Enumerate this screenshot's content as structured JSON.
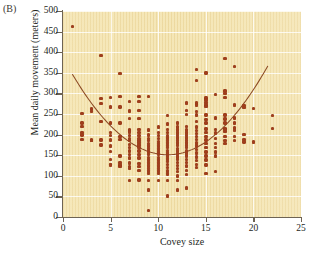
{
  "panel": {
    "label": "(B)"
  },
  "chart_data": {
    "type": "scatter",
    "title": "",
    "subtitle": "",
    "xlabel": "Covey size",
    "ylabel": "Mean daily movement (meters)",
    "xlim": [
      0,
      25
    ],
    "ylim": [
      0,
      500
    ],
    "xticks": [
      0,
      5,
      10,
      15,
      20,
      25
    ],
    "yticks": [
      0,
      50,
      100,
      150,
      200,
      250,
      300,
      350,
      400,
      450,
      500
    ],
    "grid": true,
    "legend": null,
    "legend_position": "none",
    "marker_color": "#a03e1c",
    "curve_color": "#8c4a24",
    "plot_background": "#f5e7b8",
    "points": [
      [
        1,
        462
      ],
      [
        2,
        251
      ],
      [
        2,
        228
      ],
      [
        2,
        219
      ],
      [
        2,
        205
      ],
      [
        2,
        199
      ],
      [
        2,
        188
      ],
      [
        3,
        262
      ],
      [
        3,
        256
      ],
      [
        3,
        187
      ],
      [
        3,
        186
      ],
      [
        4,
        392
      ],
      [
        4,
        288
      ],
      [
        4,
        275
      ],
      [
        4,
        232
      ],
      [
        4,
        187
      ],
      [
        4,
        175
      ],
      [
        5,
        290
      ],
      [
        5,
        267
      ],
      [
        5,
        228
      ],
      [
        5,
        205
      ],
      [
        5,
        198
      ],
      [
        5,
        187
      ],
      [
        5,
        172
      ],
      [
        5,
        159
      ],
      [
        5,
        140
      ],
      [
        5,
        128
      ],
      [
        5,
        126
      ],
      [
        6,
        348
      ],
      [
        6,
        292
      ],
      [
        6,
        267
      ],
      [
        6,
        228
      ],
      [
        6,
        196
      ],
      [
        6,
        188
      ],
      [
        6,
        148
      ],
      [
        6,
        132
      ],
      [
        6,
        126
      ],
      [
        6,
        122
      ],
      [
        7,
        281
      ],
      [
        7,
        257
      ],
      [
        7,
        239
      ],
      [
        7,
        212
      ],
      [
        7,
        209
      ],
      [
        7,
        206
      ],
      [
        7,
        198
      ],
      [
        7,
        190
      ],
      [
        7,
        186
      ],
      [
        7,
        176
      ],
      [
        7,
        168
      ],
      [
        7,
        160
      ],
      [
        7,
        152
      ],
      [
        7,
        143
      ],
      [
        7,
        131
      ],
      [
        7,
        122
      ],
      [
        7,
        118
      ],
      [
        7,
        89
      ],
      [
        8,
        292
      ],
      [
        8,
        280
      ],
      [
        8,
        258
      ],
      [
        8,
        239
      ],
      [
        8,
        212
      ],
      [
        8,
        205
      ],
      [
        8,
        198
      ],
      [
        8,
        190
      ],
      [
        8,
        186
      ],
      [
        8,
        181
      ],
      [
        8,
        175
      ],
      [
        8,
        168
      ],
      [
        8,
        160
      ],
      [
        8,
        152
      ],
      [
        8,
        143
      ],
      [
        8,
        130
      ],
      [
        8,
        122
      ],
      [
        8,
        113
      ],
      [
        8,
        90
      ],
      [
        9,
        292
      ],
      [
        9,
        211
      ],
      [
        9,
        199
      ],
      [
        9,
        190
      ],
      [
        9,
        185
      ],
      [
        9,
        178
      ],
      [
        9,
        172
      ],
      [
        9,
        165
      ],
      [
        9,
        158
      ],
      [
        9,
        152
      ],
      [
        9,
        145
      ],
      [
        9,
        138
      ],
      [
        9,
        131
      ],
      [
        9,
        124
      ],
      [
        9,
        118
      ],
      [
        9,
        112
      ],
      [
        9,
        105
      ],
      [
        9,
        88
      ],
      [
        9,
        66
      ],
      [
        9,
        16
      ],
      [
        10,
        218
      ],
      [
        10,
        205
      ],
      [
        10,
        198
      ],
      [
        10,
        190
      ],
      [
        10,
        184
      ],
      [
        10,
        178
      ],
      [
        10,
        172
      ],
      [
        10,
        165
      ],
      [
        10,
        158
      ],
      [
        10,
        152
      ],
      [
        10,
        145
      ],
      [
        10,
        138
      ],
      [
        10,
        131
      ],
      [
        10,
        124
      ],
      [
        10,
        118
      ],
      [
        10,
        112
      ],
      [
        10,
        105
      ],
      [
        10,
        88
      ],
      [
        11,
        247
      ],
      [
        11,
        226
      ],
      [
        11,
        212
      ],
      [
        11,
        205
      ],
      [
        11,
        198
      ],
      [
        11,
        192
      ],
      [
        11,
        186
      ],
      [
        11,
        180
      ],
      [
        11,
        174
      ],
      [
        11,
        168
      ],
      [
        11,
        162
      ],
      [
        11,
        155
      ],
      [
        11,
        148
      ],
      [
        11,
        141
      ],
      [
        11,
        134
      ],
      [
        11,
        127
      ],
      [
        11,
        120
      ],
      [
        11,
        112
      ],
      [
        11,
        104
      ],
      [
        11,
        88
      ],
      [
        11,
        51
      ],
      [
        12,
        228
      ],
      [
        12,
        218
      ],
      [
        12,
        211
      ],
      [
        12,
        204
      ],
      [
        12,
        198
      ],
      [
        12,
        192
      ],
      [
        12,
        186
      ],
      [
        12,
        180
      ],
      [
        12,
        173
      ],
      [
        12,
        166
      ],
      [
        12,
        160
      ],
      [
        12,
        153
      ],
      [
        12,
        146
      ],
      [
        12,
        139
      ],
      [
        12,
        132
      ],
      [
        12,
        125
      ],
      [
        12,
        118
      ],
      [
        12,
        110
      ],
      [
        12,
        100
      ],
      [
        12,
        88
      ],
      [
        12,
        66
      ],
      [
        13,
        277
      ],
      [
        13,
        258
      ],
      [
        13,
        249
      ],
      [
        13,
        220
      ],
      [
        13,
        211
      ],
      [
        13,
        204
      ],
      [
        13,
        198
      ],
      [
        13,
        192
      ],
      [
        13,
        186
      ],
      [
        13,
        180
      ],
      [
        13,
        174
      ],
      [
        13,
        168
      ],
      [
        13,
        162
      ],
      [
        13,
        155
      ],
      [
        13,
        148
      ],
      [
        13,
        140
      ],
      [
        13,
        132
      ],
      [
        13,
        124
      ],
      [
        13,
        113
      ],
      [
        13,
        103
      ],
      [
        13,
        70
      ],
      [
        14,
        358
      ],
      [
        14,
        332
      ],
      [
        14,
        277
      ],
      [
        14,
        272
      ],
      [
        14,
        256
      ],
      [
        14,
        248
      ],
      [
        14,
        232
      ],
      [
        14,
        218
      ],
      [
        14,
        210
      ],
      [
        14,
        202
      ],
      [
        14,
        195
      ],
      [
        14,
        188
      ],
      [
        14,
        180
      ],
      [
        14,
        172
      ],
      [
        14,
        164
      ],
      [
        14,
        155
      ],
      [
        14,
        146
      ],
      [
        14,
        137
      ],
      [
        14,
        128
      ],
      [
        14,
        120
      ],
      [
        15,
        350
      ],
      [
        15,
        289
      ],
      [
        15,
        284
      ],
      [
        15,
        278
      ],
      [
        15,
        272
      ],
      [
        15,
        268
      ],
      [
        15,
        248
      ],
      [
        15,
        236
      ],
      [
        15,
        228
      ],
      [
        15,
        214
      ],
      [
        15,
        205
      ],
      [
        15,
        196
      ],
      [
        15,
        187
      ],
      [
        15,
        178
      ],
      [
        15,
        168
      ],
      [
        15,
        158
      ],
      [
        15,
        148
      ],
      [
        15,
        138
      ],
      [
        15,
        126
      ],
      [
        15,
        105
      ],
      [
        16,
        297
      ],
      [
        16,
        240
      ],
      [
        16,
        213
      ],
      [
        16,
        204
      ],
      [
        16,
        190
      ],
      [
        16,
        178
      ],
      [
        16,
        168
      ],
      [
        16,
        158
      ],
      [
        16,
        148
      ],
      [
        16,
        110
      ],
      [
        17,
        384
      ],
      [
        17,
        306
      ],
      [
        17,
        300
      ],
      [
        17,
        290
      ],
      [
        17,
        248
      ],
      [
        17,
        238
      ],
      [
        17,
        228
      ],
      [
        17,
        215
      ],
      [
        17,
        212
      ],
      [
        17,
        208
      ],
      [
        17,
        196
      ],
      [
        17,
        186
      ],
      [
        17,
        178
      ],
      [
        18,
        365
      ],
      [
        18,
        272
      ],
      [
        18,
        240
      ],
      [
        18,
        228
      ],
      [
        18,
        216
      ],
      [
        18,
        210
      ],
      [
        18,
        196
      ],
      [
        18,
        186
      ],
      [
        19,
        270
      ],
      [
        19,
        266
      ],
      [
        19,
        200
      ],
      [
        19,
        188
      ],
      [
        19,
        182
      ],
      [
        20,
        264
      ],
      [
        20,
        182
      ],
      [
        22,
        247
      ],
      [
        22,
        215
      ]
    ],
    "fit_curve": {
      "label": "quadratic fit",
      "description": "U-shaped quadratic regression line, minimum near covey size 11",
      "vertex_x": 11,
      "vertex_y": 151,
      "x_start": 1,
      "x_end": 21.5,
      "y_start": 281,
      "y_end": 348,
      "coefficients": {
        "a": 1.95,
        "b": -42.9,
        "c": 387.0
      }
    }
  }
}
